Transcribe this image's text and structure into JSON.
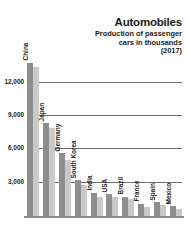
{
  "header": {
    "title": "Automobiles",
    "subtitle_lines": [
      "Production of passenger",
      "cars in thousands",
      "(2017)"
    ]
  },
  "axis": {
    "tick_labels": [
      "3,000",
      "6,000",
      "9,000",
      "12,000"
    ]
  },
  "chart_data": {
    "type": "bar",
    "title": "Automobiles",
    "subtitle": "Production of passenger cars in thousands (2017)",
    "xlabel": "",
    "ylabel": "Production of passenger cars in thousands",
    "ylim": [
      0,
      14400
    ],
    "yticks": [
      3000,
      6000,
      9000,
      12000
    ],
    "ytick_labels": [
      "3,000",
      "6,000",
      "9,000",
      "12,000"
    ],
    "grid": true,
    "legend": "none",
    "orientation": "vertical",
    "categories": [
      "China",
      "Japan",
      "Germany",
      "South Korea",
      "India",
      "USA",
      "Brazil",
      "France",
      "Spain",
      "Mexico"
    ],
    "series": [
      {
        "name": "primary",
        "color": "#8e8e8e",
        "values": [
          13800,
          8350,
          5650,
          3200,
          2100,
          1950,
          1750,
          1100,
          1250,
          900
        ]
      },
      {
        "name": "secondary",
        "color": "#c9c9c9",
        "values": [
          13400,
          7900,
          5050,
          2750,
          1750,
          1700,
          1500,
          800,
          950,
          600
        ]
      }
    ]
  }
}
